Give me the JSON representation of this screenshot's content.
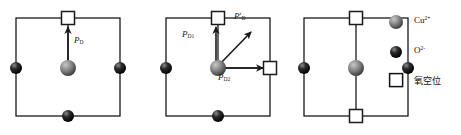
{
  "figure": {
    "type": "crystal-lattice-polarization-diagram",
    "background": "#ffffff",
    "line_color": "#1a1a1a",
    "panels": [
      {
        "id": "panel-a",
        "name": "single-vacancy-top",
        "cell": {
          "x": 16,
          "y": 18,
          "w": 104,
          "h": 98
        },
        "squares": [
          {
            "name": "vacancy-top",
            "cx": 68,
            "cy": 18
          }
        ],
        "gray_spheres": [
          {
            "name": "cu-center",
            "cx": 68,
            "cy": 68,
            "r": 8
          }
        ],
        "black_spheres": [
          {
            "name": "o-left",
            "cx": 16,
            "cy": 68,
            "r": 6
          },
          {
            "name": "o-right",
            "cx": 120,
            "cy": 68,
            "r": 6
          },
          {
            "name": "o-bottom",
            "cx": 68,
            "cy": 116,
            "r": 6
          }
        ],
        "arrows": [
          {
            "name": "arrow-pd",
            "x1": 68,
            "y1": 60,
            "x2": 68,
            "y2": 26,
            "label": "P",
            "sub": "D",
            "prime": false
          }
        ],
        "labels": [
          {
            "name": "label-pd",
            "text_base": "P",
            "text_sub": "D",
            "prime": false,
            "x": 74,
            "y": 38
          }
        ]
      },
      {
        "id": "panel-b",
        "name": "double-vacancy-top-right",
        "cell": {
          "x": 166,
          "y": 18,
          "w": 104,
          "h": 98
        },
        "squares": [
          {
            "name": "vacancy-top",
            "cx": 218,
            "cy": 18
          },
          {
            "name": "vacancy-right",
            "cx": 270,
            "cy": 68
          }
        ],
        "gray_spheres": [
          {
            "name": "cu-center",
            "cx": 218,
            "cy": 68,
            "r": 8
          }
        ],
        "black_spheres": [
          {
            "name": "o-left",
            "cx": 166,
            "cy": 68,
            "r": 6
          },
          {
            "name": "o-bottom",
            "cx": 218,
            "cy": 116,
            "r": 6
          }
        ],
        "arrows": [
          {
            "name": "arrow-pd1",
            "x1": 218,
            "y1": 62,
            "x2": 218,
            "y2": 27,
            "label": "P",
            "sub": "D1",
            "prime": false
          },
          {
            "name": "arrow-pd-prime",
            "x1": 218,
            "y1": 65,
            "x2": 250,
            "y2": 32,
            "label": "P",
            "sub": "D",
            "prime": true
          },
          {
            "name": "arrow-pd2",
            "x1": 222,
            "y1": 68,
            "x2": 264,
            "y2": 68,
            "label": "P",
            "sub": "D2",
            "prime": false
          }
        ],
        "labels": [
          {
            "name": "label-pd1",
            "text_base": "P",
            "text_sub": "D1",
            "prime": false,
            "x": 184,
            "y": 33
          },
          {
            "name": "label-pd-prime",
            "text_base": "P",
            "text_sub": "D",
            "prime": true,
            "x": 234,
            "y": 16
          },
          {
            "name": "label-pd2",
            "text_base": "P",
            "text_sub": "D2",
            "prime": false,
            "x": 219,
            "y": 74
          }
        ]
      },
      {
        "id": "panel-c",
        "name": "double-vacancy-top-bottom",
        "cell": {
          "x": 304,
          "y": 18,
          "w": 104,
          "h": 98
        },
        "squares": [
          {
            "name": "vacancy-top",
            "cx": 356,
            "cy": 18
          },
          {
            "name": "vacancy-bottom",
            "cx": 356,
            "cy": 116
          }
        ],
        "gray_spheres": [
          {
            "name": "cu-center",
            "cx": 356,
            "cy": 68,
            "r": 8
          }
        ],
        "black_spheres": [
          {
            "name": "o-left",
            "cx": 304,
            "cy": 68,
            "r": 6
          },
          {
            "name": "o-right",
            "cx": 408,
            "cy": 68,
            "r": 6
          }
        ],
        "arrows": [],
        "labels": []
      }
    ]
  },
  "legend": {
    "name": "legend",
    "items": [
      {
        "key": "cu-ion",
        "marker": "gray-sphere",
        "label_base": "Cu",
        "label_sup": "2+",
        "kind": "chem",
        "y": 12
      },
      {
        "key": "o-ion",
        "marker": "black-sphere",
        "label_base": "O",
        "label_sup": "2-",
        "kind": "chem",
        "y": 42
      },
      {
        "key": "oxygen-vacancy",
        "marker": "white-square",
        "label_base": "氧空位",
        "label_sup": "",
        "kind": "cn",
        "y": 70
      }
    ]
  },
  "caption": {
    "name": "figure-caption",
    "text": ""
  },
  "colors": {
    "line": "#1a1a1a",
    "cu_sphere_light": "#9a9a9a",
    "cu_sphere_dark": "#4a4a4a",
    "o_sphere_light": "#5a5a5a",
    "o_sphere_dark": "#000000",
    "vacancy_fill": "#ffffff",
    "text": "#111111"
  }
}
